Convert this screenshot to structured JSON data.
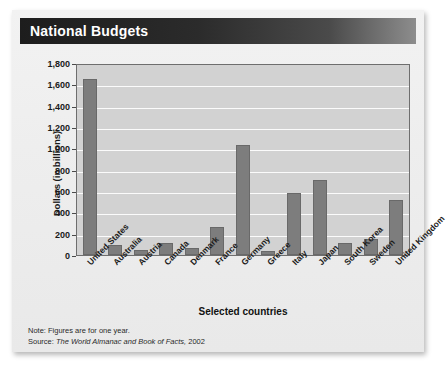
{
  "header": {
    "title": "National Budgets"
  },
  "footnotes": {
    "note_label": "Note:",
    "note_text": "Figures are for one year.",
    "source_label": "Source:",
    "source_title": "The World Almanac and Book of Facts,",
    "source_year": "2002"
  },
  "colors": {
    "bar": "#7d7d7d",
    "bar_border": "#696969",
    "plot_background": "#d2d2d2",
    "gridline": "#fbfbfb",
    "title_bar_dark": "#1d1d1d",
    "title_text": "#ffffff",
    "panel_background": "#eeeeee"
  },
  "chart_data": {
    "type": "bar",
    "title": "National Budgets",
    "xlabel": "Selected countries",
    "ylabel": "Dollars (in billions)",
    "ylim": [
      0,
      1800
    ],
    "ytick_step": 200,
    "yticks": [
      0,
      200,
      400,
      600,
      800,
      1000,
      1200,
      1400,
      1600,
      1800
    ],
    "ytick_labels": [
      "0",
      "200",
      "400",
      "600",
      "800",
      "1,000",
      "1,200",
      "1,400",
      "1,600",
      "1,800"
    ],
    "grid": true,
    "legend": false,
    "units": "billions of dollars",
    "categories": [
      "United States",
      "Australia",
      "Austria",
      "Canada",
      "Denmark",
      "France",
      "Germany",
      "Greece",
      "Italy",
      "Japan",
      "South Korea",
      "Sweden",
      "United Kingdom"
    ],
    "values": [
      1650,
      90,
      50,
      110,
      70,
      260,
      1030,
      40,
      580,
      700,
      110,
      150,
      520
    ]
  }
}
